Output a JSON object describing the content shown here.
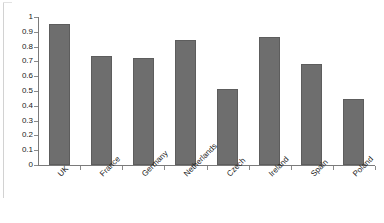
{
  "chart_data": {
    "type": "bar",
    "title": "",
    "subtitle": "",
    "xlabel": "",
    "ylabel": "",
    "categories": [
      "UK",
      "France",
      "Germany",
      "Netherlands",
      "Czech",
      "Ireland",
      "Spain",
      "Poland"
    ],
    "values": [
      0.95,
      0.735,
      0.72,
      0.845,
      0.515,
      0.865,
      0.68,
      0.445
    ],
    "series": [
      {
        "name": "",
        "values": [
          0.95,
          0.735,
          0.72,
          0.845,
          0.515,
          0.865,
          0.68,
          0.445
        ]
      }
    ],
    "ylim": [
      0,
      1
    ],
    "xlim": [
      0,
      8
    ],
    "ytick_labels": [
      "0",
      "0.1",
      "0.2",
      "0.3",
      "0.4",
      "0.5",
      "0.6",
      "0.7",
      "0.8",
      "0.9",
      "1"
    ],
    "ytick_values": [
      0,
      0.1,
      0.2,
      0.3,
      0.4,
      0.5,
      0.6,
      0.7,
      0.8,
      0.9,
      1
    ],
    "grid": false,
    "legend": false,
    "legend_position": "none",
    "annotations": [],
    "bar_color": "#6e6e6e",
    "bar_border_color": "#5d5d5d",
    "axis_color": "#7a7a7a",
    "background_color": "#ffffff",
    "text_color": "#1a1a1a",
    "xlabel_rotation_deg": -45
  }
}
